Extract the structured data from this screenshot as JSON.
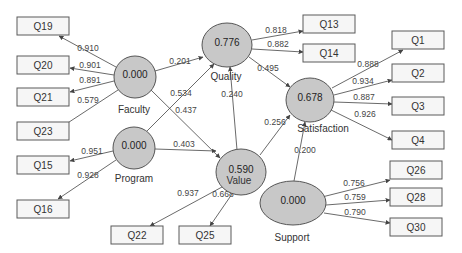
{
  "diagram": {
    "type": "PLS structural equation model",
    "latent_variables": [
      {
        "id": "faculty",
        "label": "Faculty",
        "r2": "0.000",
        "cx": 135,
        "cy": 77,
        "rx": 21,
        "ry": 21,
        "label_x": 134,
        "label_y": 113
      },
      {
        "id": "program",
        "label": "Program",
        "r2": "0.000",
        "cx": 134,
        "cy": 148,
        "rx": 21,
        "ry": 21,
        "label_x": 134,
        "label_y": 182
      },
      {
        "id": "quality",
        "label": "Quality",
        "r2": "0.776",
        "cx": 227,
        "cy": 45,
        "rx": 25,
        "ry": 22,
        "label_x": 226,
        "label_y": 80
      },
      {
        "id": "value",
        "label": "Value",
        "r2": "0.590",
        "cx": 241,
        "cy": 172,
        "rx": 25,
        "ry": 23,
        "label_x": 239,
        "label_y": 184
      },
      {
        "id": "satisfaction",
        "label": "Satisfaction",
        "r2": "0.678",
        "cx": 310,
        "cy": 100,
        "rx": 24,
        "ry": 22,
        "label_x": 323,
        "label_y": 132
      },
      {
        "id": "support",
        "label": "Support",
        "r2": "0.000",
        "cx": 293,
        "cy": 203,
        "rx": 33,
        "ry": 22,
        "label_x": 292,
        "label_y": 241
      }
    ],
    "indicators": [
      {
        "id": "Q19",
        "label": "Q19",
        "x": 17,
        "y": 17,
        "w": 52,
        "h": 18
      },
      {
        "id": "Q20",
        "label": "Q20",
        "x": 17,
        "y": 56,
        "w": 52,
        "h": 18
      },
      {
        "id": "Q21",
        "label": "Q21",
        "x": 17,
        "y": 88,
        "w": 52,
        "h": 18
      },
      {
        "id": "Q23",
        "label": "Q23",
        "x": 17,
        "y": 122,
        "w": 52,
        "h": 18
      },
      {
        "id": "Q15",
        "label": "Q15",
        "x": 17,
        "y": 156,
        "w": 52,
        "h": 18
      },
      {
        "id": "Q16",
        "label": "Q16",
        "x": 17,
        "y": 200,
        "w": 52,
        "h": 18
      },
      {
        "id": "Q22",
        "label": "Q22",
        "x": 111,
        "y": 226,
        "w": 52,
        "h": 18
      },
      {
        "id": "Q25",
        "label": "Q25",
        "x": 179,
        "y": 226,
        "w": 52,
        "h": 18
      },
      {
        "id": "Q13",
        "label": "Q13",
        "x": 303,
        "y": 15,
        "w": 52,
        "h": 18
      },
      {
        "id": "Q14",
        "label": "Q14",
        "x": 303,
        "y": 44,
        "w": 52,
        "h": 18
      },
      {
        "id": "Q1",
        "label": "Q1",
        "x": 392,
        "y": 31,
        "w": 52,
        "h": 18
      },
      {
        "id": "Q2",
        "label": "Q2",
        "x": 392,
        "y": 64,
        "w": 52,
        "h": 18
      },
      {
        "id": "Q3",
        "label": "Q3",
        "x": 392,
        "y": 97,
        "w": 52,
        "h": 18
      },
      {
        "id": "Q4",
        "label": "Q4",
        "x": 392,
        "y": 131,
        "w": 52,
        "h": 18
      },
      {
        "id": "Q26",
        "label": "Q26",
        "x": 390,
        "y": 161,
        "w": 52,
        "h": 18
      },
      {
        "id": "Q28",
        "label": "Q28",
        "x": 390,
        "y": 188,
        "w": 52,
        "h": 18
      },
      {
        "id": "Q30",
        "label": "Q30",
        "x": 390,
        "y": 218,
        "w": 52,
        "h": 18
      }
    ],
    "outer_loadings": [
      {
        "from": "faculty",
        "to": "Q19",
        "value": "0.910",
        "x1": 116,
        "y1": 67,
        "x2": 59,
        "y2": 36,
        "lx": 88,
        "ly": 51
      },
      {
        "from": "faculty",
        "to": "Q20",
        "value": "0.901",
        "x1": 114,
        "y1": 75,
        "x2": 70,
        "y2": 68,
        "lx": 90,
        "ly": 68
      },
      {
        "from": "faculty",
        "to": "Q21",
        "value": "0.891",
        "x1": 114,
        "y1": 81,
        "x2": 70,
        "y2": 92,
        "lx": 90,
        "ly": 83
      },
      {
        "from": "faculty",
        "to": "Q23",
        "value": "0.579",
        "x1": 118,
        "y1": 90,
        "x2": 60,
        "y2": 128,
        "lx": 88,
        "ly": 103
      },
      {
        "from": "program",
        "to": "Q15",
        "value": "0.951",
        "x1": 113,
        "y1": 151,
        "x2": 70,
        "y2": 161,
        "lx": 92,
        "ly": 154
      },
      {
        "from": "program",
        "to": "Q16",
        "value": "0.928",
        "x1": 116,
        "y1": 160,
        "x2": 58,
        "y2": 199,
        "lx": 88,
        "ly": 178
      },
      {
        "from": "quality",
        "to": "Q13",
        "value": "0.818",
        "x1": 252,
        "y1": 40,
        "x2": 303,
        "y2": 31,
        "lx": 276,
        "ly": 33
      },
      {
        "from": "quality",
        "to": "Q14",
        "value": "0.882",
        "x1": 252,
        "y1": 49,
        "x2": 303,
        "y2": 52,
        "lx": 278,
        "ly": 47
      },
      {
        "from": "satisfaction",
        "to": "Q1",
        "value": "0.888",
        "x1": 332,
        "y1": 88,
        "x2": 403,
        "y2": 50,
        "lx": 368,
        "ly": 67
      },
      {
        "from": "satisfaction",
        "to": "Q2",
        "value": "0.934",
        "x1": 334,
        "y1": 95,
        "x2": 392,
        "y2": 80,
        "lx": 363,
        "ly": 84
      },
      {
        "from": "satisfaction",
        "to": "Q3",
        "value": "0.887",
        "x1": 334,
        "y1": 102,
        "x2": 392,
        "y2": 104,
        "lx": 364,
        "ly": 100
      },
      {
        "from": "satisfaction",
        "to": "Q4",
        "value": "0.926",
        "x1": 331,
        "y1": 110,
        "x2": 392,
        "y2": 140,
        "lx": 365,
        "ly": 117
      },
      {
        "from": "value",
        "to": "Q22",
        "value": "0.937",
        "x1": 222,
        "y1": 187,
        "x2": 150,
        "y2": 226,
        "lx": 188,
        "ly": 196
      },
      {
        "from": "value",
        "to": "Q25",
        "value": "0.668",
        "x1": 232,
        "y1": 194,
        "x2": 210,
        "y2": 226,
        "lx": 223,
        "ly": 197
      },
      {
        "from": "support",
        "to": "Q26",
        "value": "0.756",
        "x1": 322,
        "y1": 197,
        "x2": 390,
        "y2": 180,
        "lx": 354,
        "ly": 186
      },
      {
        "from": "support",
        "to": "Q28",
        "value": "0.759",
        "x1": 326,
        "y1": 205,
        "x2": 390,
        "y2": 200,
        "lx": 355,
        "ly": 200
      },
      {
        "from": "support",
        "to": "Q30",
        "value": "0.790",
        "x1": 324,
        "y1": 213,
        "x2": 390,
        "y2": 223,
        "lx": 355,
        "ly": 215
      }
    ],
    "path_coefficients": [
      {
        "from": "faculty",
        "to": "quality",
        "value": "0.201",
        "x1": 155,
        "y1": 71,
        "x2": 203,
        "y2": 57,
        "lx": 180,
        "ly": 64
      },
      {
        "from": "faculty",
        "to": "value",
        "value": "0.437",
        "x1": 151,
        "y1": 90,
        "x2": 220,
        "y2": 158,
        "lx": 186,
        "ly": 113
      },
      {
        "from": "program",
        "to": "quality",
        "value": "0.534",
        "x1": 147,
        "y1": 131,
        "x2": 214,
        "y2": 64,
        "lx": 181,
        "ly": 96
      },
      {
        "from": "program",
        "to": "value",
        "value": "0.403",
        "x1": 155,
        "y1": 149,
        "x2": 216,
        "y2": 151,
        "lx": 184,
        "ly": 147
      },
      {
        "from": "quality",
        "to": "satisfaction",
        "value": "0.495",
        "x1": 249,
        "y1": 57,
        "x2": 290,
        "y2": 87,
        "lx": 268,
        "ly": 71
      },
      {
        "from": "value",
        "to": "quality",
        "value": "0.240",
        "x1": 237,
        "y1": 150,
        "x2": 230,
        "y2": 67,
        "lx": 232,
        "ly": 97
      },
      {
        "from": "value",
        "to": "satisfaction",
        "value": "0.256",
        "x1": 260,
        "y1": 155,
        "x2": 290,
        "y2": 115,
        "lx": 275,
        "ly": 125
      },
      {
        "from": "support",
        "to": "satisfaction",
        "value": "0.200",
        "x1": 294,
        "y1": 181,
        "x2": 305,
        "y2": 122,
        "lx": 305,
        "ly": 153
      }
    ],
    "colors": {
      "latent_fill": "#c8c8c8",
      "latent_stroke": "#555555",
      "indicator_fill": "#f6f6f6",
      "indicator_stroke": "#5a5a5a",
      "arrow": "#444444",
      "background": "#ffffff"
    }
  }
}
